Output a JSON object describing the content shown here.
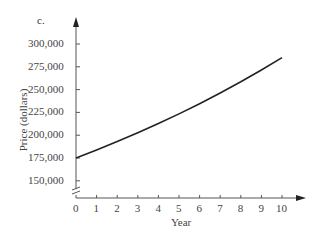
{
  "panel_label": "c.",
  "chart_data": {
    "type": "line",
    "title": "",
    "panel": "c.",
    "xlabel": "Year",
    "ylabel": "Price (dollars)",
    "x_ticks": [
      "0",
      "1",
      "2",
      "3",
      "4",
      "5",
      "6",
      "7",
      "8",
      "9",
      "10"
    ],
    "y_ticks": [
      "150,000",
      "175,000",
      "200,000",
      "225,000",
      "250,000",
      "275,000",
      "300,000"
    ],
    "xlim": [
      0,
      11
    ],
    "ylim": [
      140000,
      315000
    ],
    "y_axis_break": true,
    "grid": false,
    "legend": null,
    "series": [
      {
        "name": "Price",
        "x": [
          0,
          1,
          2,
          3,
          4,
          5,
          6,
          7,
          8,
          9,
          10
        ],
        "values": [
          175000,
          183750,
          192938,
          202584,
          212714,
          223350,
          234517,
          246243,
          258555,
          271482,
          285057
        ]
      }
    ]
  }
}
